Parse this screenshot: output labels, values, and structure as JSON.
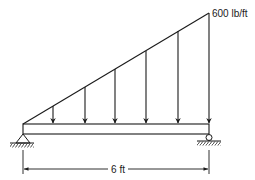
{
  "diagram": {
    "type": "simply supported beam with linearly varying distributed load",
    "load": {
      "label": "600 lb/ft",
      "max_intensity": 600,
      "unit": "lb/ft",
      "distribution": "triangular, zero at left support increasing to max at right support",
      "arrow_count": 6
    },
    "beam": {
      "span_label": "6 ft",
      "span": 6,
      "unit": "ft"
    },
    "supports": {
      "left": "pin",
      "right": "roller"
    },
    "colors": {
      "stroke": "#1a1a1a",
      "background": "#ffffff"
    }
  }
}
